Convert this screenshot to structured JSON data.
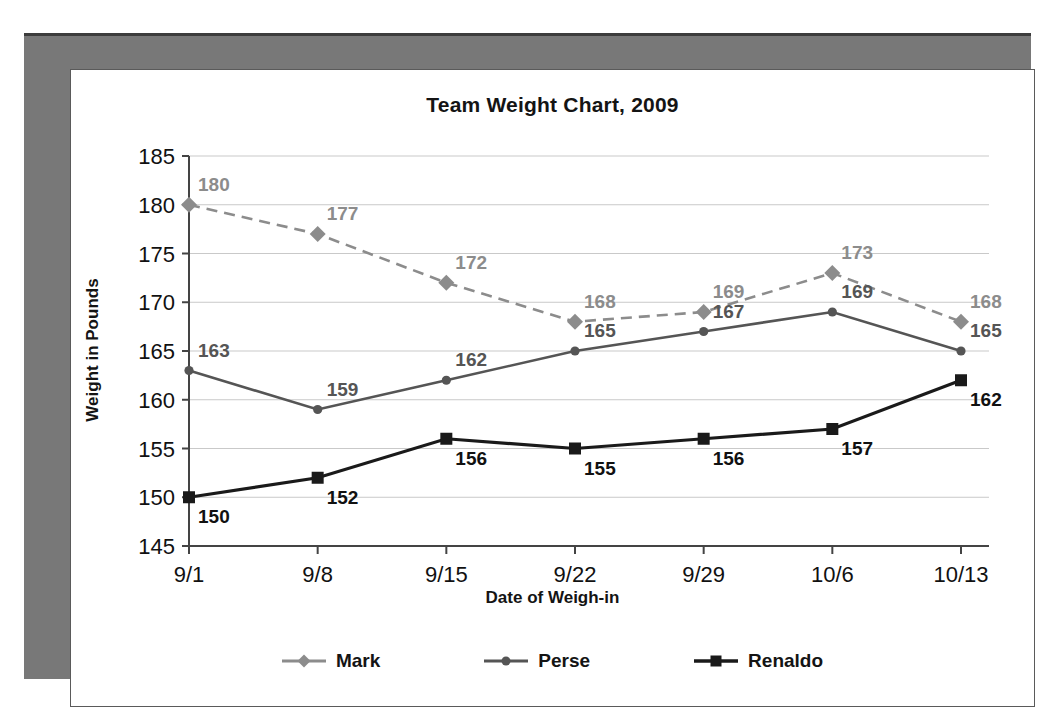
{
  "chart_data": {
    "type": "line",
    "title": "Team Weight Chart, 2009",
    "xlabel": "Date of Weigh-in",
    "ylabel": "Weight in Pounds",
    "categories": [
      "9/1",
      "9/8",
      "9/15",
      "9/22",
      "9/29",
      "10/6",
      "10/13"
    ],
    "ylim": [
      145,
      185
    ],
    "yticks": [
      145,
      150,
      155,
      160,
      165,
      170,
      175,
      180,
      185
    ],
    "grid": true,
    "legend_position": "bottom",
    "series": [
      {
        "name": "Mark",
        "values": [
          180,
          177,
          172,
          168,
          169,
          173,
          168
        ],
        "color": "#8c8c8c",
        "marker": "diamond",
        "dash": true,
        "label_color": "#8c8c8c",
        "label_position": "above-right"
      },
      {
        "name": "Perse",
        "values": [
          163,
          159,
          162,
          165,
          167,
          169,
          165
        ],
        "color": "#555555",
        "marker": "circle",
        "dash": false,
        "label_color": "#555555",
        "label_position": "above-right"
      },
      {
        "name": "Renaldo",
        "values": [
          150,
          152,
          156,
          155,
          156,
          157,
          162
        ],
        "color": "#1a1a1a",
        "marker": "square",
        "dash": false,
        "label_color": "#111111",
        "label_position": "below-right"
      }
    ]
  },
  "legend": {
    "items": [
      {
        "label": "Mark"
      },
      {
        "label": "Perse"
      },
      {
        "label": "Renaldo"
      }
    ]
  },
  "colors": {
    "page_background": "#ffffff",
    "frame_gray": "#787878",
    "gridline": "#c9c9c9",
    "axis": "#444444"
  }
}
